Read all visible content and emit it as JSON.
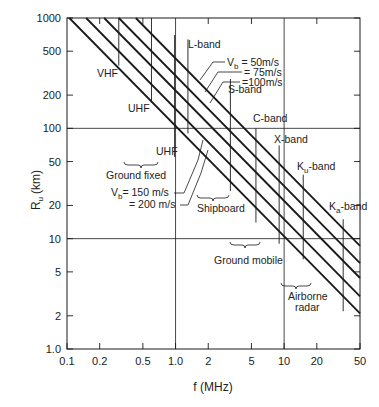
{
  "chart_data": {
    "type": "line",
    "title": "",
    "xlabel": "f (MHz)",
    "ylabel": "R_u (km)",
    "xscale": "log",
    "yscale": "log",
    "xlim": [
      0.1,
      50
    ],
    "ylim": [
      1.0,
      1000
    ],
    "grid": "major decades only (x=1, x=10, y=10, y=100)",
    "x_ticks": [
      0.1,
      0.2,
      0.5,
      1.0,
      2,
      5,
      10,
      20,
      50
    ],
    "x_tick_labels": [
      "0.1",
      "0.2",
      "0.5",
      "1.0",
      "2",
      "5",
      "10",
      "20",
      "50"
    ],
    "y_ticks": [
      1.0,
      2,
      5,
      10,
      20,
      50,
      100,
      200,
      500,
      1000
    ],
    "y_tick_labels": [
      "1.0",
      "2",
      "5",
      "10",
      "20",
      "50",
      "100",
      "200",
      "500",
      "1000"
    ],
    "series": [
      {
        "name": "Vb = 200 m/s",
        "relation": "R = K/f",
        "K": 105,
        "x": [
          0.105,
          50
        ],
        "values": [
          1000,
          2.1
        ]
      },
      {
        "name": "Vb = 150 m/s",
        "relation": "R = K/f",
        "K": 150,
        "x": [
          0.15,
          50
        ],
        "values": [
          1000,
          3.0
        ]
      },
      {
        "name": "Vb = 100 m/s",
        "relation": "R = K/f",
        "K": 220,
        "x": [
          0.22,
          50
        ],
        "values": [
          1000,
          4.4
        ]
      },
      {
        "name": "Vb = 75 m/s",
        "relation": "R = K/f",
        "K": 300,
        "x": [
          0.3,
          50
        ],
        "values": [
          1000,
          6.0
        ]
      },
      {
        "name": "Vb = 50 m/s",
        "relation": "R = K/f",
        "K": 430,
        "x": [
          0.43,
          50
        ],
        "values": [
          1000,
          8.6
        ]
      }
    ],
    "band_markers": [
      {
        "label": "VHF",
        "f": 0.3,
        "y_top": 1000,
        "y_bottom": 370
      },
      {
        "label": "UHF",
        "f": 0.6,
        "y_top": 1000,
        "y_bottom": 170
      },
      {
        "label": "UHF",
        "f": 0.98,
        "y_top": 700,
        "y_bottom": 55
      },
      {
        "label": "L-band",
        "f": 1.3,
        "y_top": 640,
        "y_bottom": 90
      },
      {
        "label": "S-band",
        "f": 3.2,
        "y_top": 280,
        "y_bottom": 27
      },
      {
        "label": "C-band",
        "f": 5.5,
        "y_top": 100,
        "y_bottom": 14
      },
      {
        "label": "X-band",
        "f": 9.0,
        "y_top": 70,
        "y_bottom": 9
      },
      {
        "label": "Ku-band",
        "f": 15,
        "y_top": 38,
        "y_bottom": 6.5
      },
      {
        "label": "Ka-band",
        "f": 35,
        "y_top": 15,
        "y_bottom": 2.2
      }
    ],
    "annotations": [
      "Vb = 50m/s",
      "= 75m/s",
      "=100m/s",
      "Vb = 150 m/s",
      "= 200 m/s",
      "Ground fixed",
      "Shipboard",
      "Ground mobile",
      "Airborne radar"
    ]
  },
  "labels": {
    "xlabel": "f (MHz)",
    "ylabel_main": "R",
    "ylabel_sub": "u",
    "ylabel_unit": "(km)",
    "vb_top_1": "V",
    "vb_top_1_sub": "b",
    "vb_top_1_rest": " = 50m/s",
    "vb_top_2": "= 75m/s",
    "vb_top_3": "=100m/s",
    "vb_bot_1": "V",
    "vb_bot_1_sub": "b",
    "vb_bot_1_rest": "= 150 m/s",
    "vb_bot_2": "= 200 m/s",
    "ground_fixed": "Ground  fixed",
    "shipboard": "Shipboard",
    "ground_mobile": "Ground mobile",
    "airborne_1": "Airborne",
    "airborne_2": "radar",
    "vhf": "VHF",
    "uhf_1": "UHF",
    "uhf_2": "UHF",
    "l_band": "L-band",
    "s_band": "S-band",
    "c_band": "C-band",
    "x_band": "X-band",
    "ku_band_main": "K",
    "ku_band_sub": "u",
    "ku_band_rest": "-band",
    "ka_band_main": "K",
    "ka_band_sub": "a",
    "ka_band_rest": "-band"
  },
  "colors": {
    "ink": "#1a1a1a",
    "background": "#ffffff"
  }
}
